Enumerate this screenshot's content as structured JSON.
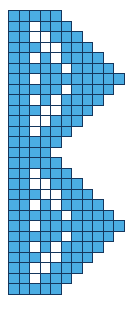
{
  "image": {
    "title": "Blue and white pixel grid pattern",
    "description": "Symmetric stepped chevron / arrow pattern rendered as a bead or cross-stitch chart",
    "width_px": 134,
    "height_px": 331
  },
  "palette": {
    "filled": "#4bade3",
    "empty": "#ffffff",
    "cell_outline": "#15365c",
    "background": "#ffffff"
  },
  "grid": {
    "columns": 11,
    "rows": 27,
    "cell_size_px": 11.5,
    "origin_x_px": 8,
    "origin_y_px": 10,
    "legend": {
      "1": "filled-blue-cell",
      "0": "empty-white-cell",
      "null": "no-cell"
    },
    "pattern": [
      [
        1,
        1,
        1,
        1,
        1,
        null,
        null,
        null,
        null,
        null,
        null
      ],
      [
        1,
        1,
        0,
        1,
        1,
        1,
        null,
        null,
        null,
        null,
        null
      ],
      [
        1,
        1,
        0,
        0,
        1,
        1,
        1,
        null,
        null,
        null,
        null
      ],
      [
        1,
        1,
        1,
        0,
        0,
        1,
        1,
        1,
        null,
        null,
        null
      ],
      [
        1,
        1,
        0,
        1,
        0,
        1,
        1,
        1,
        1,
        null,
        null
      ],
      [
        1,
        1,
        1,
        1,
        1,
        0,
        1,
        1,
        1,
        1,
        null
      ],
      [
        1,
        1,
        0,
        1,
        1,
        1,
        1,
        1,
        1,
        1,
        1
      ],
      [
        1,
        1,
        1,
        1,
        1,
        0,
        1,
        1,
        1,
        1,
        null
      ],
      [
        1,
        1,
        0,
        1,
        0,
        1,
        1,
        1,
        1,
        null,
        null
      ],
      [
        1,
        1,
        1,
        0,
        0,
        1,
        1,
        1,
        null,
        null,
        null
      ],
      [
        1,
        1,
        0,
        0,
        1,
        1,
        1,
        null,
        null,
        null,
        null
      ],
      [
        1,
        1,
        0,
        1,
        1,
        1,
        null,
        null,
        null,
        null,
        null
      ],
      [
        1,
        1,
        1,
        1,
        1,
        null,
        null,
        null,
        null,
        null,
        null
      ],
      [
        1,
        1,
        1,
        1,
        null,
        null,
        null,
        null,
        null,
        null,
        null
      ],
      [
        1,
        1,
        1,
        1,
        1,
        null,
        null,
        null,
        null,
        null,
        null
      ],
      [
        1,
        1,
        0,
        1,
        1,
        1,
        null,
        null,
        null,
        null,
        null
      ],
      [
        1,
        1,
        0,
        0,
        1,
        1,
        1,
        null,
        null,
        null,
        null
      ],
      [
        1,
        1,
        1,
        0,
        0,
        1,
        1,
        1,
        null,
        null,
        null
      ],
      [
        1,
        1,
        0,
        1,
        0,
        1,
        1,
        1,
        1,
        null,
        null
      ],
      [
        1,
        1,
        1,
        1,
        1,
        0,
        1,
        1,
        1,
        1,
        null
      ],
      [
        1,
        1,
        0,
        1,
        1,
        1,
        1,
        1,
        1,
        1,
        1
      ],
      [
        1,
        1,
        1,
        1,
        1,
        0,
        1,
        1,
        1,
        1,
        null
      ],
      [
        1,
        1,
        0,
        1,
        0,
        1,
        1,
        1,
        1,
        null,
        null
      ],
      [
        1,
        1,
        1,
        0,
        0,
        1,
        1,
        1,
        null,
        null,
        null
      ],
      [
        1,
        1,
        0,
        0,
        1,
        1,
        1,
        null,
        null,
        null,
        null
      ],
      [
        1,
        1,
        0,
        1,
        1,
        1,
        null,
        null,
        null,
        null,
        null
      ],
      [
        1,
        1,
        1,
        1,
        1,
        null,
        null,
        null,
        null,
        null,
        null
      ]
    ]
  }
}
